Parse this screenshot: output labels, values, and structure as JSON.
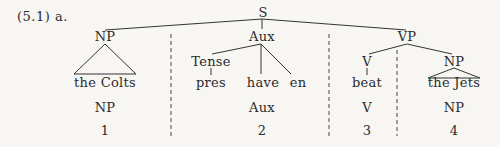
{
  "example_label": "(5.1) a.",
  "tree": {
    "root": "S",
    "np1": {
      "label": "NP",
      "terminal": "the Colts"
    },
    "aux": {
      "label": "Aux",
      "tense": {
        "label": "Tense",
        "terminal": "pres"
      },
      "have": "have",
      "en": "en"
    },
    "vp": {
      "label": "VP",
      "v": {
        "label": "V",
        "terminal": "beat"
      },
      "np2": {
        "label": "NP",
        "terminal": "the Jets"
      }
    }
  },
  "segments": [
    {
      "category": "NP",
      "index": "1"
    },
    {
      "category": "Aux",
      "index": "2"
    },
    {
      "category": "V",
      "index": "3"
    },
    {
      "category": "NP",
      "index": "4"
    }
  ]
}
